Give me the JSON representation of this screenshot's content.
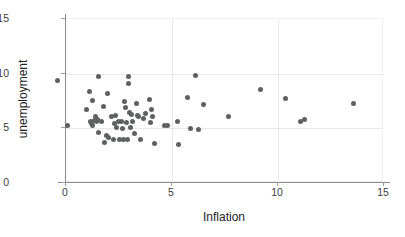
{
  "chart_data": {
    "type": "scatter",
    "title": "",
    "xlabel": "Inflation",
    "ylabel": "unemployment",
    "xlim": [
      0,
      15
    ],
    "ylim": [
      0,
      15
    ],
    "xticks": [
      "0",
      "5",
      "10",
      "15"
    ],
    "ytick_values": [
      0,
      5,
      10,
      15
    ],
    "yticks": [
      "0",
      "5",
      "10",
      "15"
    ],
    "xtick_values": [
      0,
      5,
      10,
      15
    ],
    "grid": "light gray gridlines at x=5,10 and y=5,10",
    "legend": "none",
    "marker_color": "#5f6062",
    "marker_size": 5,
    "points": [
      {
        "x": -0.35,
        "y": 9.3
      },
      {
        "x": 0.1,
        "y": 5.2
      },
      {
        "x": 1.0,
        "y": 6.6
      },
      {
        "x": 1.15,
        "y": 8.25
      },
      {
        "x": 1.2,
        "y": 5.55
      },
      {
        "x": 1.25,
        "y": 5.35
      },
      {
        "x": 1.3,
        "y": 5.15
      },
      {
        "x": 1.3,
        "y": 7.45
      },
      {
        "x": 1.4,
        "y": 5.6
      },
      {
        "x": 1.45,
        "y": 5.95
      },
      {
        "x": 1.5,
        "y": 5.5
      },
      {
        "x": 1.55,
        "y": 5.75
      },
      {
        "x": 1.6,
        "y": 9.65
      },
      {
        "x": 1.6,
        "y": 4.5
      },
      {
        "x": 1.7,
        "y": 5.55
      },
      {
        "x": 1.8,
        "y": 6.95
      },
      {
        "x": 1.85,
        "y": 3.6
      },
      {
        "x": 1.95,
        "y": 4.25
      },
      {
        "x": 2.0,
        "y": 8.1
      },
      {
        "x": 2.05,
        "y": 4.05
      },
      {
        "x": 2.2,
        "y": 5.95
      },
      {
        "x": 2.3,
        "y": 3.9
      },
      {
        "x": 2.35,
        "y": 5.35
      },
      {
        "x": 2.4,
        "y": 6.05
      },
      {
        "x": 2.45,
        "y": 5.0
      },
      {
        "x": 2.5,
        "y": 5.5
      },
      {
        "x": 2.55,
        "y": 3.85
      },
      {
        "x": 2.65,
        "y": 5.55
      },
      {
        "x": 2.7,
        "y": 4.85
      },
      {
        "x": 2.75,
        "y": 3.85
      },
      {
        "x": 2.8,
        "y": 7.35
      },
      {
        "x": 2.85,
        "y": 6.85
      },
      {
        "x": 2.9,
        "y": 5.45
      },
      {
        "x": 2.95,
        "y": 3.85
      },
      {
        "x": 3.0,
        "y": 9.65
      },
      {
        "x": 3.0,
        "y": 9.05
      },
      {
        "x": 3.05,
        "y": 6.35
      },
      {
        "x": 3.1,
        "y": 4.95
      },
      {
        "x": 3.15,
        "y": 6.15
      },
      {
        "x": 3.2,
        "y": 5.55
      },
      {
        "x": 3.3,
        "y": 4.45
      },
      {
        "x": 3.35,
        "y": 7.15
      },
      {
        "x": 3.4,
        "y": 6.05
      },
      {
        "x": 3.45,
        "y": 5.95
      },
      {
        "x": 3.55,
        "y": 3.85
      },
      {
        "x": 3.7,
        "y": 5.85
      },
      {
        "x": 3.8,
        "y": 6.25
      },
      {
        "x": 4.0,
        "y": 7.55
      },
      {
        "x": 4.05,
        "y": 5.4
      },
      {
        "x": 4.1,
        "y": 6.65
      },
      {
        "x": 4.15,
        "y": 5.95
      },
      {
        "x": 4.2,
        "y": 3.5
      },
      {
        "x": 4.7,
        "y": 5.2
      },
      {
        "x": 4.85,
        "y": 5.15
      },
      {
        "x": 5.3,
        "y": 5.55
      },
      {
        "x": 5.35,
        "y": 3.4
      },
      {
        "x": 5.8,
        "y": 7.75
      },
      {
        "x": 5.9,
        "y": 4.85
      },
      {
        "x": 6.15,
        "y": 9.75
      },
      {
        "x": 6.3,
        "y": 4.8
      },
      {
        "x": 6.55,
        "y": 7.1
      },
      {
        "x": 7.7,
        "y": 6.0
      },
      {
        "x": 9.2,
        "y": 8.5
      },
      {
        "x": 10.4,
        "y": 7.6
      },
      {
        "x": 11.1,
        "y": 5.55
      },
      {
        "x": 11.3,
        "y": 5.75
      },
      {
        "x": 13.6,
        "y": 7.2
      }
    ]
  }
}
